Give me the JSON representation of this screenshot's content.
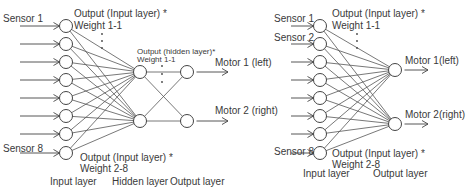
{
  "diagrams": [
    {
      "id": "with-hidden-layer",
      "input_nodes": [
        {
          "label": "Sensor 1"
        },
        {
          "label": ""
        },
        {
          "label": ""
        },
        {
          "label": ""
        },
        {
          "label": ""
        },
        {
          "label": ""
        },
        {
          "label": ""
        },
        {
          "label": "Sensor 8"
        }
      ],
      "hidden_nodes": 2,
      "output_nodes": [
        {
          "label": "Motor 1 (left)"
        },
        {
          "label": "Motor 2 (right)"
        }
      ],
      "annotations": {
        "top_line1": "Output (Input layer) *",
        "top_line2": "Weight 1-1",
        "bottom_line1": "Output (Input layer) *",
        "bottom_line2": "Weight 2-8",
        "hidden_line1": "Output (hidden layer)*",
        "hidden_line2": "Weight 1-1"
      },
      "layer_labels": {
        "input": "Input layer",
        "hidden": "Hidden layer",
        "output": "Output layer"
      }
    },
    {
      "id": "without-hidden-layer",
      "input_nodes": [
        {
          "label": "Sensor 1"
        },
        {
          "label": "Sensor 2"
        },
        {
          "label": ""
        },
        {
          "label": ""
        },
        {
          "label": ""
        },
        {
          "label": ""
        },
        {
          "label": ""
        },
        {
          "label": "Sensor 8"
        }
      ],
      "output_nodes": [
        {
          "label": "Motor 1(left)"
        },
        {
          "label": "Motor 2(right)"
        }
      ],
      "annotations": {
        "top_line1": "Output (Input layer) *",
        "top_line2": "Weight 1-1",
        "bottom_line1": "Output (Input layer) *",
        "bottom_line2": "Weight 2-8"
      },
      "layer_labels": {
        "input": "Input layer",
        "output": "Output layer"
      }
    }
  ]
}
